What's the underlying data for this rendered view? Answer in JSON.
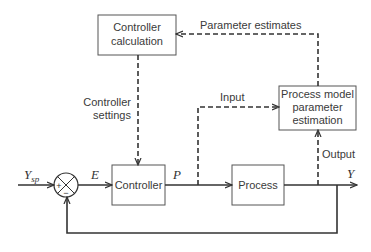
{
  "diagram": {
    "type": "block-diagram",
    "blocks": {
      "controller_calc": {
        "line1": "Controller",
        "line2": "calculation"
      },
      "process_model": {
        "line1": "Process model",
        "line2": "parameter",
        "line3": "estimation"
      },
      "controller": {
        "label": "Controller"
      },
      "process": {
        "label": "Process"
      }
    },
    "summing_junction": {
      "plus": "+",
      "minus": "−"
    },
    "signals": {
      "setpoint": {
        "main": "Y",
        "sub": "sp"
      },
      "error": "E",
      "controller_output": "P",
      "output": "Y",
      "parameter_estimates": "Parameter estimates",
      "controller_settings_line1": "Controller",
      "controller_settings_line2": "settings",
      "input": "Input",
      "output_label": "Output"
    },
    "colors": {
      "stroke": "#333333",
      "box_border": "#555555",
      "text": "#3a3a3a",
      "background": "#ffffff"
    }
  }
}
